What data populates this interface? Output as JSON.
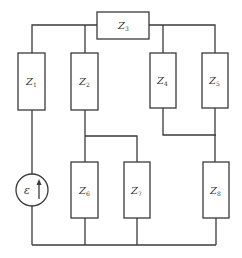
{
  "diagram": {
    "type": "circuit",
    "components": [
      {
        "id": "Z1",
        "label": "Z",
        "sub": "1"
      },
      {
        "id": "Z2",
        "label": "Z",
        "sub": "2"
      },
      {
        "id": "Z3",
        "label": "Z",
        "sub": "3"
      },
      {
        "id": "Z4",
        "label": "Z",
        "sub": "4"
      },
      {
        "id": "Z5",
        "label": "Z",
        "sub": "5"
      },
      {
        "id": "Z6",
        "label": "Z",
        "sub": "6"
      },
      {
        "id": "Z7",
        "label": "Z",
        "sub": "7"
      },
      {
        "id": "Z8",
        "label": "Z",
        "sub": "8"
      }
    ],
    "source": {
      "label": "ε",
      "direction": "up"
    },
    "colors": {
      "line": "#3a3a3a",
      "background": "#ffffff"
    }
  }
}
